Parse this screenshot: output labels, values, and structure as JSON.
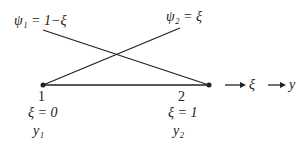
{
  "diagram": {
    "shape_functions": [
      {
        "name": "psi1",
        "label": "ψ₁ = 1−ξ"
      },
      {
        "name": "psi2",
        "label": "ψ₂ = ξ"
      }
    ],
    "nodes": [
      {
        "id": "1",
        "number": "1",
        "xi": "ξ = 0",
        "value": "y₁"
      },
      {
        "id": "2",
        "number": "2",
        "xi": "ξ = 1",
        "value": "y₂"
      }
    ],
    "axes": [
      {
        "name": "xi-axis",
        "label": "ξ"
      },
      {
        "name": "y-axis",
        "label": "y"
      }
    ],
    "colors": {
      "line": "#222222",
      "background": "#ffffff"
    }
  }
}
